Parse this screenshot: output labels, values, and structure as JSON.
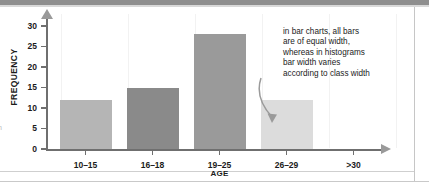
{
  "chart_data": {
    "type": "bar",
    "title": "",
    "xlabel": "AGE",
    "ylabel": "FREQUENCY",
    "categories": [
      "10–15",
      "16–18",
      "19–25",
      "26–29",
      ">30"
    ],
    "values": [
      12,
      15,
      28,
      12,
      0
    ],
    "bar_colors": [
      "#b5b5b5",
      "#8a8a8a",
      "#9a9a9a",
      "#dcdcdc",
      "none"
    ],
    "ylim": [
      0,
      32
    ],
    "yticks": [
      0,
      5,
      10,
      15,
      20,
      25,
      30
    ],
    "ytick_labels": [
      "0",
      "5",
      "10",
      "15",
      "20",
      "25",
      "30"
    ],
    "grid": false,
    "legend": "none",
    "annotations": [
      {
        "text_lines": [
          "in bar charts, all bars",
          "are of equal width,",
          "whereas in histograms",
          "bar width varies",
          "according to class width"
        ],
        "points_to_category": "26–29",
        "arrow": "curved-down-arrow"
      }
    ]
  },
  "axes": {
    "y_title": "FREQUENCY",
    "x_title": "AGE",
    "y_arrow": "up-arrow-icon",
    "x_arrow": "right-arrow-icon"
  },
  "page": {
    "margin_fragment": "n"
  },
  "colors": {
    "axis": "#6f6f6f",
    "arrow": "#9a9a9a",
    "text": "#1b1b1b",
    "gridline": "#f2f2f2",
    "top_band": "#8f8f8f",
    "rule": "#c9c9c9"
  }
}
